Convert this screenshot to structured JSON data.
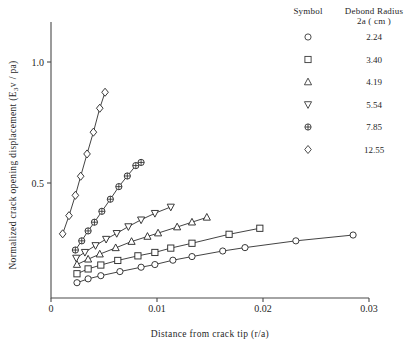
{
  "chart_data": {
    "type": "line",
    "title": "",
    "xlabel": "Distance from crack tip (r/a)",
    "ylabel": "Normalized crack opening displacement  (E3v / pa)",
    "ylabel_prefix": "Normalized crack opening displacement  (E",
    "ylabel_sub": "3",
    "ylabel_suffix": "v / pa)",
    "xlim": [
      0,
      0.03
    ],
    "ylim": [
      0,
      1.12
    ],
    "xticks": [
      0,
      0.01,
      0.02,
      0.03
    ],
    "xtick_labels": [
      "0",
      "0.01",
      "0.02",
      "0.03"
    ],
    "yticks": [
      0.5,
      1.0
    ],
    "ytick_labels": [
      "0.5",
      "1.0"
    ],
    "grid": false,
    "legend_position": "top-right",
    "legend_title_symbol": "Symbol",
    "legend_title_value_line1": "Debond Radius",
    "legend_title_value_line2": "2a ( cm )",
    "series": [
      {
        "name": "2.24",
        "legend_label": "2.24",
        "marker": "circle",
        "x": [
          0.00245,
          0.0035,
          0.0047,
          0.0065,
          0.0085,
          0.0098,
          0.0115,
          0.0133,
          0.0162,
          0.0183,
          0.0231,
          0.0285
        ],
        "y": [
          0.088,
          0.104,
          0.117,
          0.134,
          0.152,
          0.163,
          0.181,
          0.196,
          0.219,
          0.233,
          0.261,
          0.285
        ]
      },
      {
        "name": "3.40",
        "legend_label": "3.40",
        "marker": "square",
        "x": [
          0.00245,
          0.0035,
          0.0047,
          0.0063,
          0.0082,
          0.0098,
          0.0113,
          0.0133,
          0.0168,
          0.0197
        ],
        "y": [
          0.125,
          0.145,
          0.161,
          0.18,
          0.199,
          0.213,
          0.231,
          0.251,
          0.288,
          0.313
        ]
      },
      {
        "name": "4.19",
        "legend_label": "4.19",
        "marker": "triangle-up",
        "x": [
          0.00245,
          0.0035,
          0.0046,
          0.0061,
          0.0076,
          0.0091,
          0.0101,
          0.0119,
          0.0133,
          0.0147
        ],
        "y": [
          0.163,
          0.185,
          0.206,
          0.232,
          0.258,
          0.279,
          0.293,
          0.318,
          0.338,
          0.358
        ]
      },
      {
        "name": "5.54",
        "legend_label": "5.54",
        "marker": "triangle-down",
        "x": [
          0.00238,
          0.0032,
          0.0042,
          0.0052,
          0.0062,
          0.0073,
          0.0085,
          0.0098,
          0.0113
        ],
        "y": [
          0.19,
          0.214,
          0.242,
          0.268,
          0.292,
          0.32,
          0.348,
          0.375,
          0.401
        ]
      },
      {
        "name": "7.85",
        "legend_label": "7.85",
        "marker": "circle-cross",
        "x": [
          0.0023,
          0.0029,
          0.0035,
          0.0041,
          0.0048,
          0.0056,
          0.0064,
          0.0072,
          0.008,
          0.0085
        ],
        "y": [
          0.223,
          0.261,
          0.302,
          0.338,
          0.383,
          0.433,
          0.485,
          0.529,
          0.572,
          0.585
        ]
      },
      {
        "name": "12.55",
        "legend_label": "12.55",
        "marker": "diamond",
        "x": [
          0.0011,
          0.0017,
          0.0023,
          0.0028,
          0.0034,
          0.004,
          0.0046,
          0.0051
        ],
        "y": [
          0.29,
          0.365,
          0.449,
          0.528,
          0.62,
          0.71,
          0.809,
          0.875
        ]
      }
    ]
  }
}
